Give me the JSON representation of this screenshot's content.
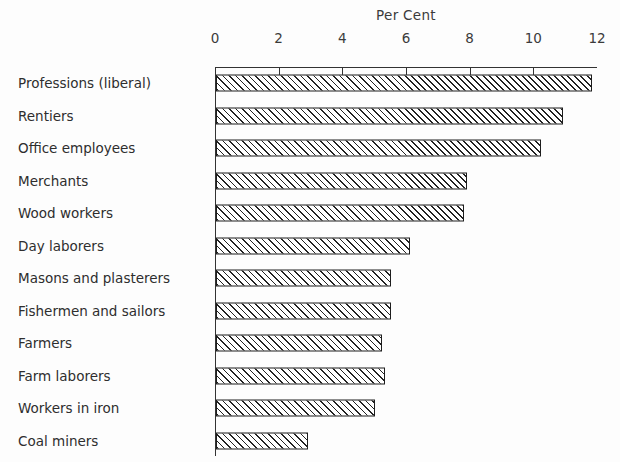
{
  "chart_data": {
    "type": "bar",
    "orientation": "horizontal",
    "title": "Per Cent",
    "xlabel": "Per Cent",
    "ylabel": "",
    "xlim": [
      0,
      12
    ],
    "grid": false,
    "legend": null,
    "xticks": [
      0,
      2,
      4,
      6,
      8,
      10,
      12
    ],
    "xtick_labels": [
      "0",
      "2",
      "4",
      "6",
      "8",
      "10",
      "12"
    ],
    "categories": [
      "Professions (liberal)",
      "Rentiers",
      "Office employees",
      "Merchants",
      "Wood workers",
      "Day laborers",
      "Masons and plasterers",
      "Fishermen and sailors",
      "Farmers",
      "Farm laborers",
      "Workers in iron",
      "Coal miners"
    ],
    "values": [
      11.8,
      10.9,
      10.2,
      7.9,
      7.8,
      6.1,
      5.5,
      5.5,
      5.2,
      5.3,
      5.0,
      2.9
    ],
    "bar_style": {
      "fill": "diagonal-hatch",
      "edge_color": "#1d1d1d",
      "face_color": "#ffffff"
    }
  }
}
